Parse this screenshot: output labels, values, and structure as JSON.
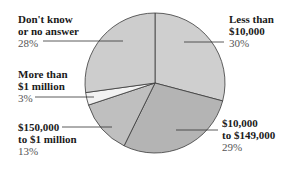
{
  "chart_data": {
    "type": "pie",
    "title": "",
    "slices": [
      {
        "label_line1": "Less than",
        "label_line2": "$10,000",
        "value": 30,
        "pct_text": "30%",
        "color": "#cfcfcf"
      },
      {
        "label_line1": "$10,000",
        "label_line2": "to $149,000",
        "value": 29,
        "pct_text": "29%",
        "color": "#b4b4b4"
      },
      {
        "label_line1": "$150,000",
        "label_line2": "to $1 million",
        "value": 13,
        "pct_text": "13%",
        "color": "#bfbfbf"
      },
      {
        "label_line1": "More than",
        "label_line2": "$1 million",
        "value": 3,
        "pct_text": "3%",
        "color": "#f2f2f2"
      },
      {
        "label_line1": "Don't know",
        "label_line2": "or no answer",
        "value": 28,
        "pct_text": "28%",
        "color": "#cdcdcd"
      }
    ],
    "start_angle_deg": 0,
    "direction": "clockwise",
    "legend": "inline leader-line labels",
    "center": [
      155,
      83
    ],
    "radius": 70
  }
}
